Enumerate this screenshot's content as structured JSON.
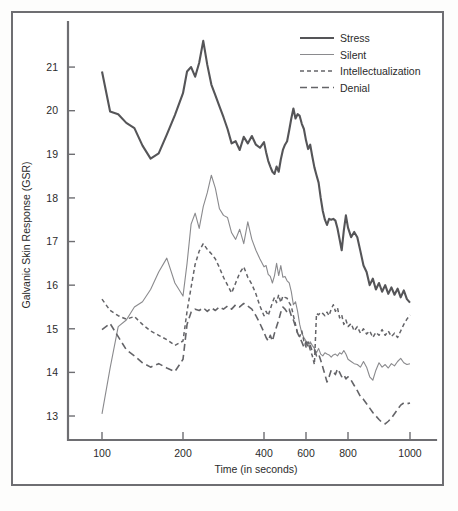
{
  "figure": {
    "background_color": "#ffffff",
    "frame_color": "#6e6e72"
  },
  "chart_data": {
    "type": "line",
    "title": "",
    "subtitle": "",
    "xlabel": "Time (in seconds)",
    "ylabel": "Galvanic Skin Response (GSR)",
    "xlim": [
      80,
      1020
    ],
    "ylim": [
      12.45,
      21.85
    ],
    "grid": false,
    "legend_position": "top-right",
    "xtick_labels": [
      "100",
      "200",
      "400",
      "600",
      "800",
      "1000"
    ],
    "xtick_values": [
      100,
      200,
      400,
      600,
      800,
      1000
    ],
    "xtick_pixel_positions": [
      102,
      183,
      264,
      306,
      348,
      410
    ],
    "ytick_labels": [
      "13",
      "14",
      "15",
      "16",
      "17",
      "18",
      "19",
      "20",
      "21"
    ],
    "ytick_values": [
      13,
      14,
      15,
      16,
      17,
      18,
      19,
      20,
      21
    ],
    "axis_note": "x tick label spacing is irregular; ticks are evenly spaced in pixel terms but labelled 100,200,400,600,800,1000",
    "x": [
      100,
      110,
      120,
      130,
      140,
      150,
      160,
      170,
      180,
      190,
      200,
      210,
      220,
      230,
      240,
      250,
      260,
      270,
      280,
      290,
      300,
      310,
      320,
      330,
      340,
      350,
      360,
      370,
      380,
      390,
      400,
      410,
      420,
      430,
      440,
      450,
      460,
      470,
      480,
      490,
      500,
      510,
      520,
      530,
      540,
      550,
      560,
      570,
      580,
      590,
      600,
      610,
      620,
      630,
      640,
      650,
      660,
      670,
      680,
      690,
      700,
      710,
      720,
      730,
      740,
      750,
      760,
      770,
      780,
      790,
      800,
      810,
      820,
      830,
      840,
      850,
      860,
      870,
      880,
      890,
      900,
      910,
      920,
      930,
      940,
      950,
      960,
      970,
      980,
      990,
      1000
    ],
    "series": [
      {
        "name": "Stress",
        "style": "solid-thick",
        "color": "#555558",
        "width": 2.1,
        "dash": "none",
        "values": [
          20.9,
          19.98,
          19.92,
          19.72,
          19.6,
          19.2,
          18.9,
          19.02,
          19.45,
          19.9,
          20.4,
          20.9,
          21.0,
          20.78,
          21.1,
          21.6,
          21.05,
          20.6,
          20.35,
          20.1,
          19.85,
          19.58,
          19.25,
          19.3,
          19.1,
          19.4,
          19.25,
          19.42,
          19.22,
          19.15,
          19.28,
          19.05,
          18.85,
          18.72,
          18.6,
          18.55,
          18.72,
          18.6,
          18.88,
          19.1,
          19.22,
          19.3,
          19.55,
          19.82,
          20.05,
          19.82,
          19.92,
          19.88,
          19.7,
          19.58,
          19.32,
          19.12,
          19.22,
          18.95,
          18.7,
          18.52,
          18.35,
          18.0,
          17.7,
          17.5,
          17.38,
          17.52,
          17.5,
          17.52,
          17.48,
          17.3,
          17.05,
          16.8,
          17.25,
          17.6,
          17.32,
          17.1,
          17.22,
          17.1,
          16.78,
          16.45,
          16.3,
          16.0,
          16.15,
          15.9,
          16.05,
          15.85,
          16.0,
          15.8,
          15.95,
          15.78,
          15.92,
          15.72,
          15.88,
          15.68,
          15.6
        ]
      },
      {
        "name": "Silent",
        "style": "solid-thin",
        "color": "#8a8a8d",
        "width": 1.1,
        "dash": "none",
        "values": [
          13.05,
          14.1,
          15.05,
          15.2,
          15.5,
          15.62,
          15.9,
          16.3,
          16.62,
          16.05,
          15.75,
          16.5,
          17.4,
          17.65,
          17.3,
          17.8,
          18.12,
          18.52,
          18.22,
          17.75,
          17.6,
          17.55,
          17.2,
          17.05,
          17.28,
          16.95,
          17.45,
          17.05,
          16.8,
          16.6,
          16.42,
          16.45,
          16.25,
          16.2,
          16.05,
          16.22,
          16.5,
          16.22,
          16.45,
          16.18,
          16.2,
          16.1,
          16.05,
          15.85,
          15.55,
          15.62,
          15.4,
          15.1,
          14.9,
          14.8,
          14.72,
          14.6,
          14.7,
          14.62,
          14.55,
          14.45,
          14.55,
          14.42,
          14.38,
          14.45,
          14.42,
          14.4,
          14.35,
          14.4,
          14.42,
          14.38,
          14.45,
          14.42,
          14.5,
          14.42,
          14.3,
          14.25,
          14.2,
          14.18,
          14.12,
          14.25,
          14.12,
          13.9,
          13.82,
          14.05,
          14.22,
          14.12,
          14.18,
          14.1,
          14.2,
          14.15,
          14.25,
          14.32,
          14.22,
          14.18,
          14.2
        ]
      },
      {
        "name": "Intellectualization",
        "style": "dashed-short",
        "color": "#646468",
        "width": 1.5,
        "dash": "4,3",
        "values": [
          15.68,
          15.42,
          15.3,
          15.22,
          15.28,
          15.1,
          14.95,
          14.85,
          14.75,
          14.62,
          14.72,
          15.4,
          15.95,
          16.48,
          16.78,
          16.95,
          16.82,
          16.72,
          16.6,
          16.4,
          16.18,
          16.0,
          15.82,
          16.05,
          16.28,
          16.42,
          16.18,
          16.02,
          15.8,
          15.52,
          15.3,
          15.4,
          15.3,
          15.45,
          15.6,
          15.72,
          15.6,
          15.78,
          15.6,
          15.75,
          15.72,
          15.7,
          15.6,
          15.52,
          15.3,
          15.1,
          14.9,
          14.82,
          14.95,
          14.72,
          14.58,
          14.7,
          14.52,
          14.38,
          14.18,
          15.35,
          15.32,
          15.38,
          15.35,
          15.3,
          15.38,
          15.3,
          15.45,
          15.55,
          15.4,
          15.48,
          15.25,
          15.32,
          15.1,
          15.2,
          15.05,
          15.12,
          14.95,
          15.05,
          14.9,
          15.0,
          14.88,
          14.95,
          14.8,
          14.92,
          14.85,
          14.98,
          14.85,
          14.95,
          14.82,
          14.9,
          14.8,
          14.95,
          15.1,
          15.22,
          15.32
        ]
      },
      {
        "name": "Denial",
        "style": "dashed-long",
        "color": "#646468",
        "width": 1.6,
        "dash": "7,4",
        "values": [
          14.98,
          15.12,
          14.82,
          14.52,
          14.38,
          14.22,
          14.12,
          14.2,
          14.1,
          14.02,
          14.3,
          15.1,
          15.38,
          15.45,
          15.42,
          15.48,
          15.4,
          15.48,
          15.42,
          15.5,
          15.45,
          15.52,
          15.45,
          15.55,
          15.5,
          15.58,
          15.52,
          15.45,
          15.3,
          15.12,
          14.92,
          14.8,
          14.72,
          14.85,
          14.72,
          14.9,
          15.05,
          15.2,
          15.38,
          15.5,
          15.45,
          15.38,
          15.45,
          15.3,
          15.2,
          15.05,
          14.9,
          14.8,
          14.7,
          14.58,
          14.7,
          14.55,
          14.62,
          14.48,
          14.52,
          14.38,
          14.42,
          14.28,
          14.12,
          13.95,
          13.78,
          13.9,
          14.05,
          14.02,
          13.95,
          14.08,
          14.0,
          13.9,
          13.95,
          13.85,
          13.9,
          13.82,
          13.7,
          13.58,
          13.45,
          13.38,
          13.28,
          13.18,
          13.08,
          13.0,
          12.92,
          12.85,
          12.82,
          12.88,
          12.95,
          13.05,
          13.15,
          13.25,
          13.3,
          13.28,
          13.3
        ]
      }
    ]
  },
  "legend": {
    "entries": [
      {
        "label": "Stress"
      },
      {
        "label": "Silent"
      },
      {
        "label": "Intellectualization"
      },
      {
        "label": "Denial"
      }
    ]
  }
}
